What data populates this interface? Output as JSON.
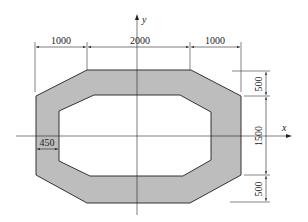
{
  "diagram": {
    "type": "cross-section",
    "shape": "hollow octagon (rounded-corner rectangular tube with chamfers)",
    "colors": {
      "fill": "#bdbdbd",
      "stroke": "#333333",
      "background": "#ffffff"
    },
    "axes": {
      "x_label": "x",
      "y_label": "y"
    },
    "dimensions": {
      "top_left": "1000",
      "top_middle": "2000",
      "top_right": "1000",
      "right_top": "500",
      "right_middle": "1500",
      "right_bottom": "500",
      "wall_thickness": "450"
    }
  }
}
